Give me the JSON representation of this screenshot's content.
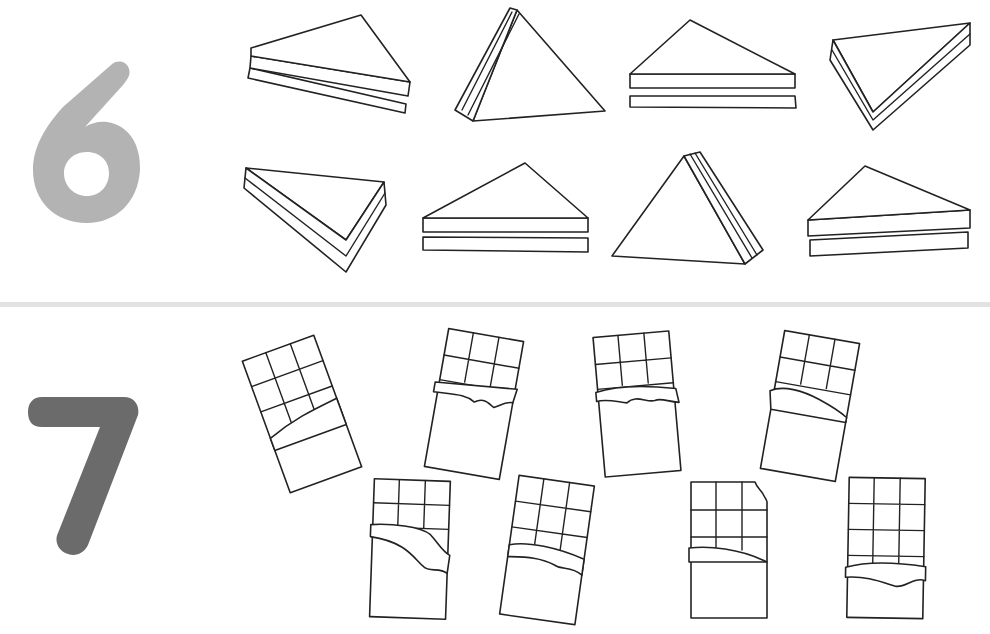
{
  "sections": [
    {
      "number": "6",
      "number_color": "#b3b3b3",
      "item": "sandwich",
      "count": 8
    },
    {
      "number": "7",
      "number_color": "#6b6b6b",
      "item": "chocolate-bar",
      "count": 8
    }
  ],
  "divider_color": "#e2e2e2"
}
